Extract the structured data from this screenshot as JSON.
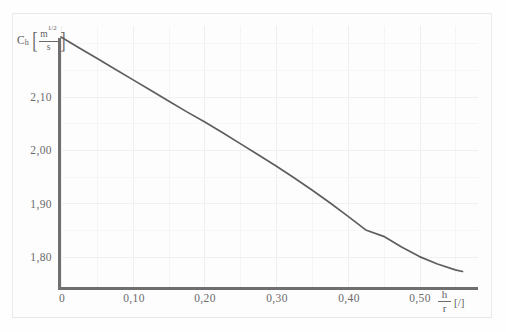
{
  "figure": {
    "background_color": "#fdfdfd",
    "frame_color": "#e9e9e9",
    "axis_color": "#6f6f6f",
    "curve_color": "#5e5e5e",
    "grid_color": "#f0eeee"
  },
  "axes": {
    "y": {
      "symbol": "C",
      "subscript": "h",
      "unit_numerator": "m",
      "unit_numerator_exponent": "1/2",
      "unit_denominator": "s",
      "bracket_open": "[",
      "bracket_close": "]",
      "tick_labels": [
        "2,10",
        "2,00",
        "1,90",
        "1,80"
      ],
      "tick_values": [
        2.1,
        2.0,
        1.9,
        1.8
      ],
      "range": [
        1.745,
        2.233
      ]
    },
    "x": {
      "numerator": "h",
      "denominator": "r",
      "unit": "[/]",
      "tick_labels": [
        "0",
        "0,10",
        "0,20",
        "0,30",
        "0,40",
        "0,50"
      ],
      "tick_values": [
        0,
        0.1,
        0.2,
        0.3,
        0.4,
        0.5
      ],
      "range": [
        0,
        0.579
      ]
    }
  },
  "chart_data": {
    "type": "line",
    "title": "",
    "subtitle": "",
    "xlabel": "h/r [/]",
    "ylabel": "C_h [m^(1/2)/s]",
    "xlim": [
      0,
      0.579
    ],
    "ylim": [
      1.745,
      2.233
    ],
    "xticks": [
      0,
      0.1,
      0.2,
      0.3,
      0.4,
      0.5
    ],
    "xticklabels": [
      "0",
      "0,10",
      "0,20",
      "0,30",
      "0,40",
      "0,50"
    ],
    "yticks": [
      1.8,
      1.9,
      2.0,
      2.1
    ],
    "yticklabels": [
      "1,80",
      "1,90",
      "2,00",
      "2,10"
    ],
    "grid": true,
    "legend": null,
    "series": [
      {
        "name": "C_h",
        "x": [
          0.0,
          0.025,
          0.05,
          0.075,
          0.1,
          0.125,
          0.15,
          0.175,
          0.2,
          0.225,
          0.25,
          0.275,
          0.3,
          0.325,
          0.35,
          0.375,
          0.4,
          0.425,
          0.45,
          0.475,
          0.5,
          0.525,
          0.55,
          0.56
        ],
        "y": [
          2.212,
          2.192,
          2.172,
          2.152,
          2.132,
          2.112,
          2.092,
          2.072,
          2.053,
          2.033,
          2.012,
          1.991,
          1.97,
          1.948,
          1.925,
          1.901,
          1.876,
          1.85,
          1.838,
          1.818,
          1.8,
          1.786,
          1.775,
          1.772
        ]
      }
    ]
  }
}
